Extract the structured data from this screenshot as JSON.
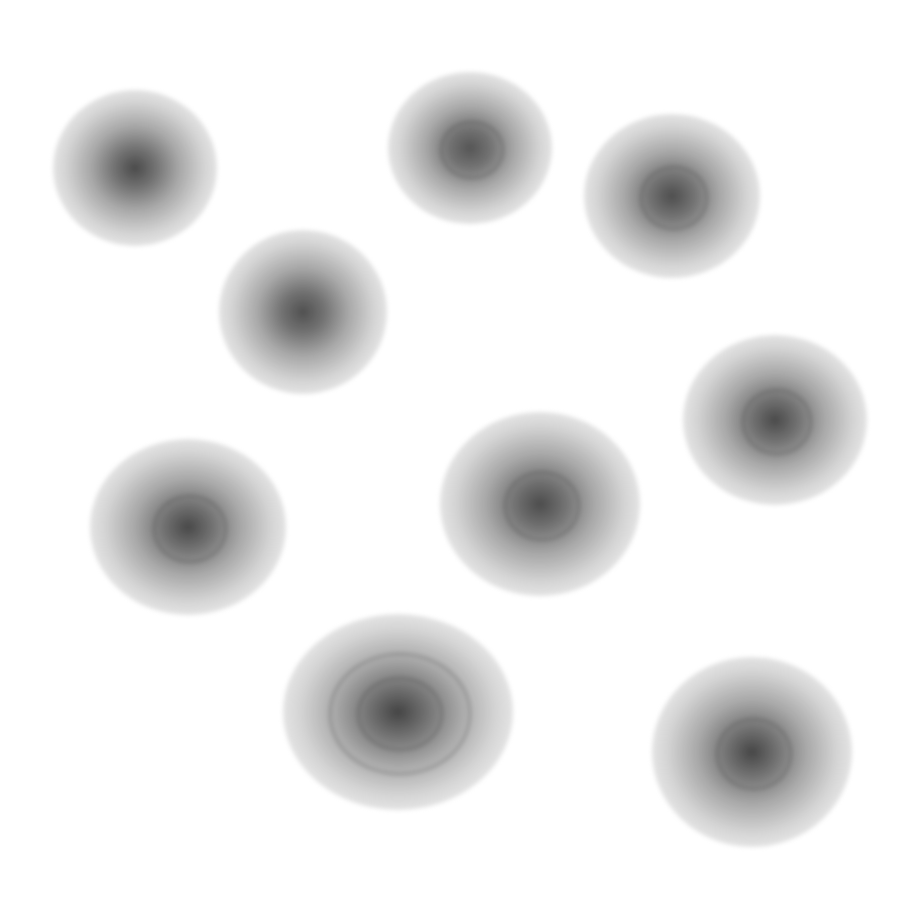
{
  "image": {
    "background": "#ffffff",
    "description": "Nine fuzzy grayscale radial blobs scattered on a white background"
  },
  "blobs": [
    {
      "cx": 135,
      "cy": 168,
      "rx": 82,
      "ry": 78,
      "core": "#4a4a4a",
      "rings": 0
    },
    {
      "cx": 470,
      "cy": 148,
      "rx": 82,
      "ry": 76,
      "core": "#555555",
      "rings": 1
    },
    {
      "cx": 672,
      "cy": 196,
      "rx": 88,
      "ry": 82,
      "core": "#4e4e4e",
      "rings": 1
    },
    {
      "cx": 303,
      "cy": 312,
      "rx": 84,
      "ry": 82,
      "core": "#505050",
      "rings": 0
    },
    {
      "cx": 775,
      "cy": 420,
      "rx": 92,
      "ry": 85,
      "core": "#4a4a4a",
      "rings": 1
    },
    {
      "cx": 188,
      "cy": 527,
      "rx": 98,
      "ry": 88,
      "core": "#484848",
      "rings": 1
    },
    {
      "cx": 540,
      "cy": 504,
      "rx": 100,
      "ry": 92,
      "core": "#4c4c4c",
      "rings": 1
    },
    {
      "cx": 398,
      "cy": 712,
      "rx": 115,
      "ry": 98,
      "core": "#444444",
      "rings": 2
    },
    {
      "cx": 752,
      "cy": 752,
      "rx": 100,
      "ry": 95,
      "core": "#464646",
      "rings": 1
    }
  ]
}
